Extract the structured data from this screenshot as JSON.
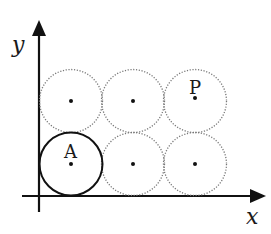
{
  "diagram": {
    "type": "circle-grid-on-axes",
    "axes": {
      "x_label": "x",
      "y_label": "y",
      "color": "#111111"
    },
    "circles": [
      {
        "row": 0,
        "col": 0,
        "style": "solid",
        "label": "A",
        "cx": 71,
        "cy": 164
      },
      {
        "row": 0,
        "col": 1,
        "style": "dotted",
        "label": "",
        "cx": 133,
        "cy": 164
      },
      {
        "row": 0,
        "col": 2,
        "style": "dotted",
        "label": "",
        "cx": 195,
        "cy": 164
      },
      {
        "row": 1,
        "col": 0,
        "style": "dotted",
        "label": "",
        "cx": 71,
        "cy": 101
      },
      {
        "row": 1,
        "col": 1,
        "style": "dotted",
        "label": "",
        "cx": 133,
        "cy": 101
      },
      {
        "row": 1,
        "col": 2,
        "style": "dotted",
        "label": "P",
        "cx": 195,
        "cy": 101
      }
    ],
    "radius": 31.5,
    "point_labels": {
      "A": "A",
      "P": "P"
    }
  }
}
